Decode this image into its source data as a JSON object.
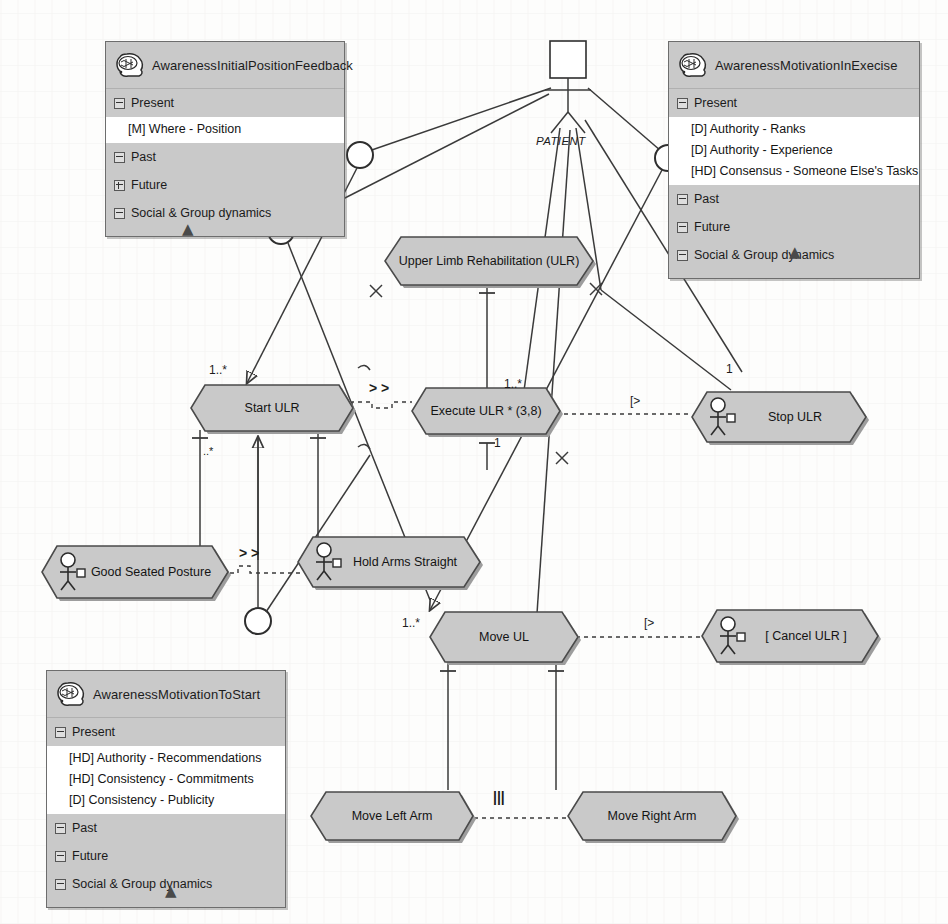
{
  "diagram": {
    "actor": {
      "name": "PATIENT",
      "icon": "actor-icon"
    },
    "colors": {
      "node_fill": "#c9c9c9",
      "panel_fill": "#c9c9c9",
      "item_fill": "#ffffff",
      "stroke": "#3a3a3a",
      "background": "#fdfdfc"
    }
  },
  "panels": [
    {
      "id": "awareness-initial-position-feedback",
      "title": "AwarenessInitialPositionFeedback",
      "icon": "brain-icon",
      "sections": [
        {
          "label": "Present",
          "state": "expanded"
        },
        {
          "label": "Past",
          "state": "expanded"
        },
        {
          "label": "Future",
          "state": "collapsed"
        },
        {
          "label": "Social & Group dynamics",
          "state": "expanded"
        }
      ],
      "items": [
        "[M] Where - Position"
      ],
      "collapse_marker": "chevron-up-double-icon"
    },
    {
      "id": "awareness-motivation-in-execise",
      "title": "AwarenessMotivationInExecise",
      "icon": "brain-icon",
      "sections": [
        {
          "label": "Present",
          "state": "expanded"
        },
        {
          "label": "Past",
          "state": "expanded"
        },
        {
          "label": "Future",
          "state": "expanded"
        },
        {
          "label": "Social & Group dynamics",
          "state": "expanded"
        }
      ],
      "items": [
        "[D] Authority - Ranks",
        "[D] Authority - Experience",
        "[HD] Consensus - Someone Else's Tasks"
      ],
      "collapse_marker": "chevron-up-double-icon"
    },
    {
      "id": "awareness-motivation-to-start",
      "title": "AwarenessMotivationToStart",
      "icon": "brain-icon",
      "sections": [
        {
          "label": "Present",
          "state": "expanded"
        },
        {
          "label": "Past",
          "state": "expanded"
        },
        {
          "label": "Future",
          "state": "expanded"
        },
        {
          "label": "Social & Group dynamics",
          "state": "expanded"
        }
      ],
      "items": [
        "[HD] Authority - Recommendations",
        "[HD] Consistency - Commitments",
        "[D] Consistency - Publicity"
      ],
      "collapse_marker": "chevron-up-double-icon"
    }
  ],
  "use_cases": [
    {
      "id": "upper-limb-rehabilitation",
      "label": "Upper Limb Rehabilitation (ULR)",
      "actor_icon": false
    },
    {
      "id": "start-ulr",
      "label": "Start ULR",
      "actor_icon": false
    },
    {
      "id": "execute-ulr",
      "label": "Execute ULR * (3,8)",
      "actor_icon": false
    },
    {
      "id": "stop-ulr",
      "label": "Stop ULR",
      "actor_icon": true
    },
    {
      "id": "good-seated-posture",
      "label": "Good Seated Posture",
      "actor_icon": true
    },
    {
      "id": "hold-arms-straight",
      "label": "Hold Arms Straight",
      "actor_icon": true
    },
    {
      "id": "move-ul",
      "label": "Move UL",
      "actor_icon": false
    },
    {
      "id": "cancel-ulr",
      "label": "[ Cancel ULR ]",
      "actor_icon": true
    },
    {
      "id": "move-left-arm",
      "label": "Move Left Arm",
      "actor_icon": false
    },
    {
      "id": "move-right-arm",
      "label": "Move Right Arm",
      "actor_icon": false
    }
  ],
  "edge_labels": {
    "patient": "PATIENT",
    "start_mult": "1..*",
    "start_bottom_mult": "..*",
    "include_start_execute": "> >",
    "execute_mult_right": "1..*",
    "execute_mult_bottom": "1",
    "stop_mult": "1",
    "interrupt_stop": "[>",
    "interrupt_cancel": "[>",
    "moveul_mult": "1..*",
    "include_posture_arms": "> >",
    "arms_parallel": "|||"
  }
}
